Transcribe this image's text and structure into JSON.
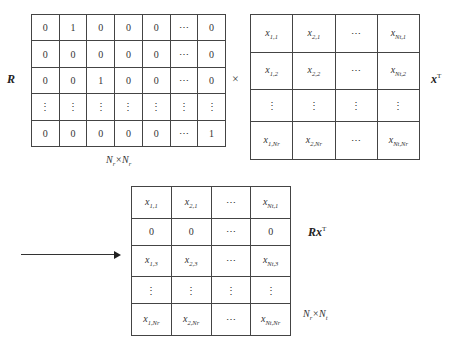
{
  "labels": {
    "R": "R",
    "times": "×",
    "xT_base": "x",
    "xT_sup": "T",
    "RxT_base": "Rx",
    "RxT_sup": "T",
    "R_dim": {
      "a": "N",
      "a_sub": "r",
      "x": "×",
      "b": "N",
      "b_sub": "r"
    },
    "RxT_dim": {
      "a": "N",
      "a_sub": "r",
      "x": "×",
      "b": "N",
      "b_sub": "t"
    }
  },
  "matrix_R": {
    "rows": [
      [
        "0",
        "1",
        "0",
        "0",
        "0",
        "⋯",
        "0"
      ],
      [
        "0",
        "0",
        "0",
        "0",
        "0",
        "⋯",
        "0"
      ],
      [
        "0",
        "0",
        "1",
        "0",
        "0",
        "⋯",
        "0"
      ],
      [
        "⋮",
        "⋮",
        "⋮",
        "⋮",
        "⋮",
        "⋮",
        "⋮"
      ],
      [
        "0",
        "0",
        "0",
        "0",
        "0",
        "⋯",
        "1"
      ]
    ]
  },
  "matrix_xT": {
    "rows": [
      [
        {
          "b": "x",
          "s": "1,1"
        },
        {
          "b": "x",
          "s": "2,1"
        },
        {
          "t": "⋯"
        },
        {
          "b": "x",
          "s": "Nt,1"
        }
      ],
      [
        {
          "b": "x",
          "s": "1,2"
        },
        {
          "b": "x",
          "s": "2,2"
        },
        {
          "t": "⋯"
        },
        {
          "b": "x",
          "s": "Nt,2"
        }
      ],
      [
        {
          "t": "⋮"
        },
        {
          "t": "⋮"
        },
        {
          "t": "⋮"
        },
        {
          "t": "⋮"
        }
      ],
      [
        {
          "b": "x",
          "s": "1,Nr"
        },
        {
          "b": "x",
          "s": "2,Nr"
        },
        {
          "t": "⋯"
        },
        {
          "b": "x",
          "s": "Nt,Nr"
        }
      ]
    ]
  },
  "matrix_RxT": {
    "rows": [
      [
        {
          "b": "x",
          "s": "1,1"
        },
        {
          "b": "x",
          "s": "2,1"
        },
        {
          "t": "⋯"
        },
        {
          "b": "x",
          "s": "Nt,1"
        }
      ],
      [
        {
          "t": "0"
        },
        {
          "t": "0"
        },
        {
          "t": "⋯"
        },
        {
          "t": "0"
        }
      ],
      [
        {
          "b": "x",
          "s": "1,3"
        },
        {
          "b": "x",
          "s": "2,3"
        },
        {
          "t": "⋯"
        },
        {
          "b": "x",
          "s": "Nt,3"
        }
      ],
      [
        {
          "t": "⋮"
        },
        {
          "t": "⋮"
        },
        {
          "t": "⋮"
        },
        {
          "t": "⋮"
        }
      ],
      [
        {
          "b": "x",
          "s": "1,Nr"
        },
        {
          "b": "x",
          "s": "2,Nr"
        },
        {
          "t": "⋯"
        },
        {
          "b": "x",
          "s": "Nt,Nr"
        }
      ]
    ]
  }
}
